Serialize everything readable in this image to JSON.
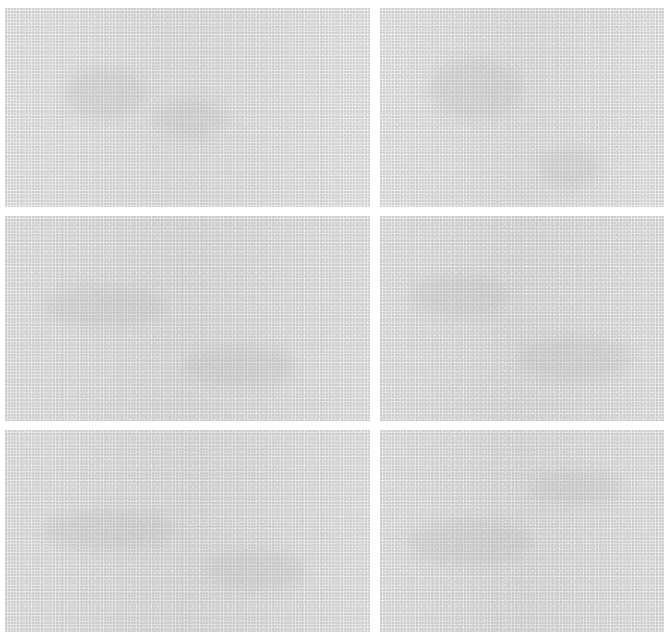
{
  "document": {
    "layout": "3 rows x 2 columns grid of scanned paper patches",
    "background_color": "#ffffff",
    "patch_color": "#dcdcdc",
    "text_legibility": "illegible"
  },
  "patches": [
    {
      "row": 1,
      "col": 1,
      "content": "",
      "legible": false
    },
    {
      "row": 1,
      "col": 2,
      "content": "",
      "legible": false
    },
    {
      "row": 2,
      "col": 1,
      "content": "",
      "legible": false
    },
    {
      "row": 2,
      "col": 2,
      "content": "",
      "legible": false
    },
    {
      "row": 3,
      "col": 1,
      "content": "",
      "legible": false
    },
    {
      "row": 3,
      "col": 2,
      "content": "",
      "legible": false
    }
  ]
}
